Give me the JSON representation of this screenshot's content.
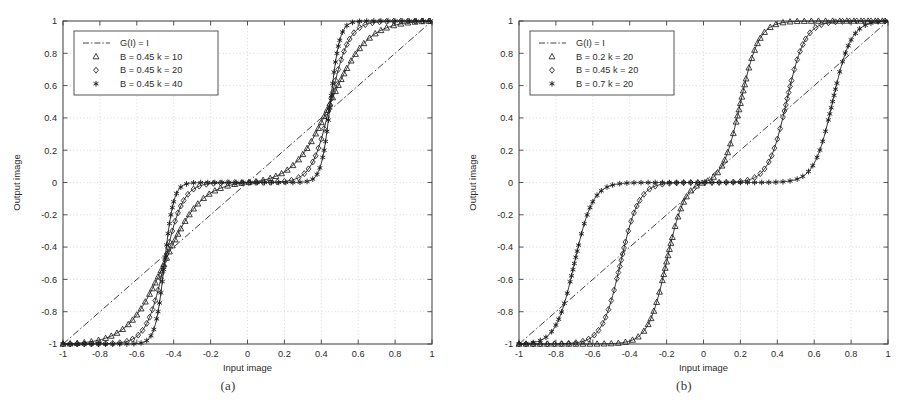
{
  "figure": {
    "background": "#ffffff",
    "ink": "#1f1f1f",
    "grid_color": "#c9c9c9",
    "axis_color": "#444444"
  },
  "panels": [
    {
      "id": "a",
      "caption": "(a)",
      "xlabel": "Input image",
      "ylabel": "Output image"
    },
    {
      "id": "b",
      "caption": "(b)",
      "xlabel": "Input image",
      "ylabel": "Output image"
    }
  ],
  "axis": {
    "xticks": [
      "-1",
      "-0.8",
      "-0.6",
      "-0.4",
      "-0.2",
      "0",
      "0.2",
      "0.4",
      "0.6",
      "0.8",
      "1"
    ],
    "yticks": [
      "-1",
      "-0.8",
      "-0.6",
      "-0.4",
      "-0.2",
      "0",
      "0.2",
      "0.4",
      "0.6",
      "0.8",
      "1"
    ],
    "xtick_values": [
      -1,
      -0.8,
      -0.6,
      -0.4,
      -0.2,
      0,
      0.2,
      0.4,
      0.6,
      0.8,
      1
    ],
    "ytick_values": [
      -1,
      -0.8,
      -0.6,
      -0.4,
      -0.2,
      0,
      0.2,
      0.4,
      0.6,
      0.8,
      1
    ]
  },
  "chart_data": [
    {
      "type": "line",
      "panel": "a",
      "title": "",
      "xlabel": "Input image",
      "ylabel": "Output image",
      "xlim": [
        -1,
        1
      ],
      "ylim": [
        -1,
        1
      ],
      "grid": true,
      "legend_position": "upper-left",
      "series": [
        {
          "name": "G(I) = I",
          "marker": "none",
          "linestyle": "dashdot",
          "identity": true,
          "B": null,
          "k": null
        },
        {
          "name": "B = 0.45 k = 10",
          "marker": "triangle",
          "linestyle": "solid",
          "identity": false,
          "B": 0.45,
          "k": 10
        },
        {
          "name": "B = 0.45 k = 20",
          "marker": "diamond",
          "linestyle": "solid",
          "identity": false,
          "B": 0.45,
          "k": 20
        },
        {
          "name": "B = 0.45 k = 40",
          "marker": "asterisk",
          "linestyle": "solid",
          "identity": false,
          "B": 0.45,
          "k": 40
        }
      ]
    },
    {
      "type": "line",
      "panel": "b",
      "title": "",
      "xlabel": "Input image",
      "ylabel": "Output image",
      "xlim": [
        -1,
        1
      ],
      "ylim": [
        -1,
        1
      ],
      "grid": true,
      "legend_position": "upper-left",
      "series": [
        {
          "name": "G(I) = I",
          "marker": "none",
          "linestyle": "dashdot",
          "identity": true,
          "B": null,
          "k": null
        },
        {
          "name": "B = 0.2  k = 20",
          "marker": "triangle",
          "linestyle": "solid",
          "identity": false,
          "B": 0.2,
          "k": 20
        },
        {
          "name": "B = 0.45 k = 20",
          "marker": "diamond",
          "linestyle": "solid",
          "identity": false,
          "B": 0.45,
          "k": 20
        },
        {
          "name": "B = 0.7  k = 20",
          "marker": "asterisk",
          "linestyle": "solid",
          "identity": false,
          "B": 0.7,
          "k": 20
        }
      ]
    }
  ]
}
